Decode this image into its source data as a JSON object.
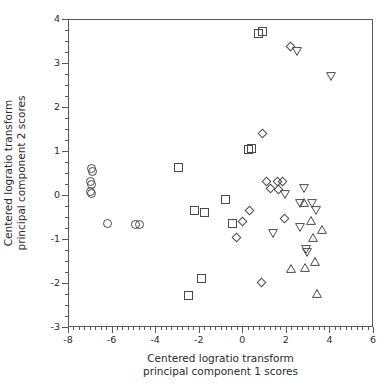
{
  "chart_data": {
    "type": "scatter",
    "title": "",
    "xlabel": "Centered logratio transform principal component 1 scores",
    "ylabel": "Centered logratio transform principal component 2 scores",
    "xlim": [
      -8,
      6
    ],
    "ylim": [
      -3,
      4
    ],
    "grid": false,
    "legend": "none",
    "xticks": [
      -8,
      -6,
      -4,
      -2,
      0,
      2,
      4,
      6
    ],
    "xticklabels": [
      "-8",
      "-6",
      "-4",
      "-2",
      "0",
      "2",
      "4",
      "6"
    ],
    "xminor_tick_step": 0.25,
    "yticks": [
      -3,
      -2,
      -1,
      0,
      1,
      2,
      3,
      4
    ],
    "yticklabels": [
      "-3",
      "-2",
      "-1",
      "0",
      "1",
      "2",
      "3",
      "4"
    ],
    "yminor_tick_step": 0.25,
    "marker_color": "#4a4a4a",
    "marker_fill": "none",
    "series": [
      {
        "name": "group-circle",
        "marker": "circle",
        "points": [
          [
            -6.97,
            0.62
          ],
          [
            -6.93,
            0.55
          ],
          [
            -7.02,
            0.33
          ],
          [
            -6.95,
            0.26
          ],
          [
            -7.03,
            0.1
          ],
          [
            -6.98,
            0.05
          ],
          [
            -6.22,
            -0.63
          ],
          [
            -4.93,
            -0.64
          ],
          [
            -4.77,
            -0.64
          ]
        ]
      },
      {
        "name": "group-square",
        "marker": "square",
        "points": [
          [
            0.72,
            3.7
          ],
          [
            0.87,
            3.74
          ],
          [
            0.22,
            1.06
          ],
          [
            0.38,
            1.09
          ],
          [
            -2.97,
            0.65
          ],
          [
            -0.82,
            -0.07
          ],
          [
            -2.22,
            -0.33
          ],
          [
            -1.77,
            -0.37
          ],
          [
            -0.48,
            -0.63
          ],
          [
            -1.93,
            -1.88
          ],
          [
            -2.52,
            -2.26
          ]
        ]
      },
      {
        "name": "group-diamond",
        "marker": "diamond",
        "points": [
          [
            2.17,
            3.39
          ],
          [
            0.86,
            1.42
          ],
          [
            1.08,
            0.32
          ],
          [
            1.55,
            0.33
          ],
          [
            1.8,
            0.33
          ],
          [
            1.23,
            0.18
          ],
          [
            1.62,
            0.14
          ],
          [
            0.28,
            -0.33
          ],
          [
            -0.05,
            -0.57
          ],
          [
            1.88,
            -0.51
          ],
          [
            -0.33,
            -0.95
          ],
          [
            0.84,
            -1.96
          ]
        ]
      },
      {
        "name": "group-triangle-down",
        "marker": "triangle-down",
        "points": [
          [
            2.47,
            3.29
          ],
          [
            4.02,
            2.72
          ],
          [
            2.78,
            0.17
          ],
          [
            1.92,
            0.04
          ],
          [
            2.62,
            -0.17
          ],
          [
            3.17,
            -0.17
          ],
          [
            3.32,
            -0.32
          ],
          [
            1.38,
            -0.86
          ],
          [
            2.62,
            -0.72
          ],
          [
            2.88,
            -1.22
          ],
          [
            2.93,
            -1.28
          ]
        ]
      },
      {
        "name": "group-triangle-up",
        "marker": "triangle-up",
        "points": [
          [
            2.77,
            -0.14
          ],
          [
            3.13,
            -0.55
          ],
          [
            3.62,
            -0.77
          ],
          [
            3.22,
            -0.95
          ],
          [
            3.27,
            -1.48
          ],
          [
            2.18,
            -1.64
          ],
          [
            2.82,
            -1.62
          ],
          [
            3.37,
            -2.22
          ]
        ]
      }
    ]
  },
  "axes": {
    "x_title_lines": [
      "Centered logratio transform",
      "principal component 1  scores"
    ],
    "y_title_lines": [
      "Centered logratio transform",
      "principal component 2 scores"
    ]
  }
}
